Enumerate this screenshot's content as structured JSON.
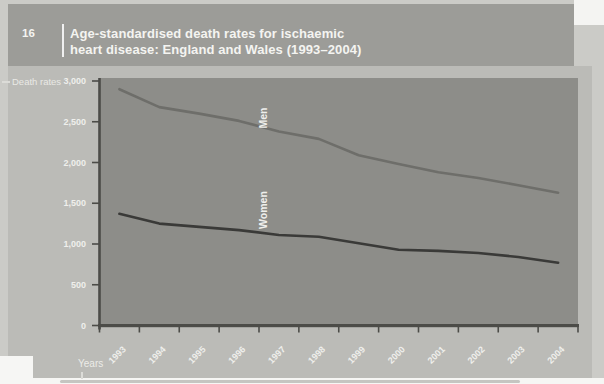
{
  "figure": {
    "number": "16",
    "title_lines": [
      "Age-standardised death rates for ischaemic",
      "heart disease: England and Wales (1993–2004)"
    ]
  },
  "chart_data": {
    "type": "line",
    "title": "Age-standardised death rates for ischaemic heart disease: England and Wales (1993–2004)",
    "xlabel": "Years",
    "ylabel": "Death rates",
    "categories": [
      "1993",
      "1994",
      "1995",
      "1996",
      "1997",
      "1998",
      "1999",
      "2000",
      "2001",
      "2002",
      "2003",
      "2004"
    ],
    "series": [
      {
        "name": "Men",
        "values": [
          2900,
          2680,
          2600,
          2510,
          2380,
          2290,
          2090,
          1980,
          1880,
          1810,
          1720,
          1630
        ],
        "color": "#6e6e6a"
      },
      {
        "name": "Women",
        "values": [
          1370,
          1250,
          1210,
          1170,
          1110,
          1090,
          1010,
          930,
          915,
          890,
          840,
          770
        ],
        "color": "#3a3a38"
      }
    ],
    "ylim": [
      0,
      3000
    ],
    "yticks": [
      0,
      500,
      1000,
      1500,
      2000,
      2500,
      3000
    ],
    "ytick_labels": [
      "0",
      "500",
      "1,000",
      "1,500",
      "2,000",
      "2,500",
      "3,000"
    ],
    "grid": false,
    "legend": "labels rotated 90° beside each line inside plot"
  },
  "colors": {
    "scan_margin": "#cbcbc7",
    "header_bg": "#9c9c98",
    "panel_bg": "#bbbbb7",
    "plot_bg": "#8d8d89",
    "axis": "#4c4c48",
    "text_light": "#efefec"
  }
}
